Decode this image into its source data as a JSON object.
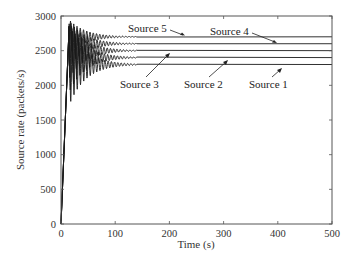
{
  "chart_data": {
    "type": "line",
    "title": "",
    "xlabel": "Time (s)",
    "ylabel": "Source rate (packets/s)",
    "xlim": [
      0,
      500
    ],
    "ylim": [
      0,
      3000
    ],
    "xticks": [
      0,
      100,
      200,
      300,
      400,
      500
    ],
    "yticks": [
      0,
      500,
      1000,
      1500,
      2000,
      2500,
      3000
    ],
    "grid": false,
    "legend": "none (inline annotations with arrows)",
    "series": [
      {
        "name": "Source 1",
        "steady_state": 2300,
        "initial_peak": 2850,
        "rise_time": 15,
        "oscillation_until": 120
      },
      {
        "name": "Source 2",
        "steady_state": 2400,
        "initial_peak": 2850,
        "rise_time": 15,
        "oscillation_until": 120
      },
      {
        "name": "Source 3",
        "steady_state": 2500,
        "initial_peak": 2850,
        "rise_time": 15,
        "oscillation_until": 120
      },
      {
        "name": "Source 4",
        "steady_state": 2600,
        "initial_peak": 2850,
        "rise_time": 15,
        "oscillation_until": 120
      },
      {
        "name": "Source 5",
        "steady_state": 2700,
        "initial_peak": 2850,
        "rise_time": 15,
        "oscillation_until": 120
      }
    ],
    "annotations": [
      {
        "text": "Source 5",
        "points_to": "Source 5 line near t=190"
      },
      {
        "text": "Source 4",
        "points_to": "Source 4 line near t=375"
      },
      {
        "text": "Source 3",
        "points_to": "Source 3 line near t=120"
      },
      {
        "text": "Source 2",
        "points_to": "Source 2 line near t=265"
      },
      {
        "text": "Source 1",
        "points_to": "Source 1 line near t=385"
      }
    ]
  },
  "labels": {
    "xlabel": "Time (s)",
    "ylabel": "Source rate (packets/s)",
    "xticks": [
      "0",
      "100",
      "200",
      "300",
      "400",
      "500"
    ],
    "yticks": [
      "0",
      "500",
      "1000",
      "1500",
      "2000",
      "2500",
      "3000"
    ],
    "annotations": [
      "Source 5",
      "Source 4",
      "Source 3",
      "Source 2",
      "Source 1"
    ]
  }
}
